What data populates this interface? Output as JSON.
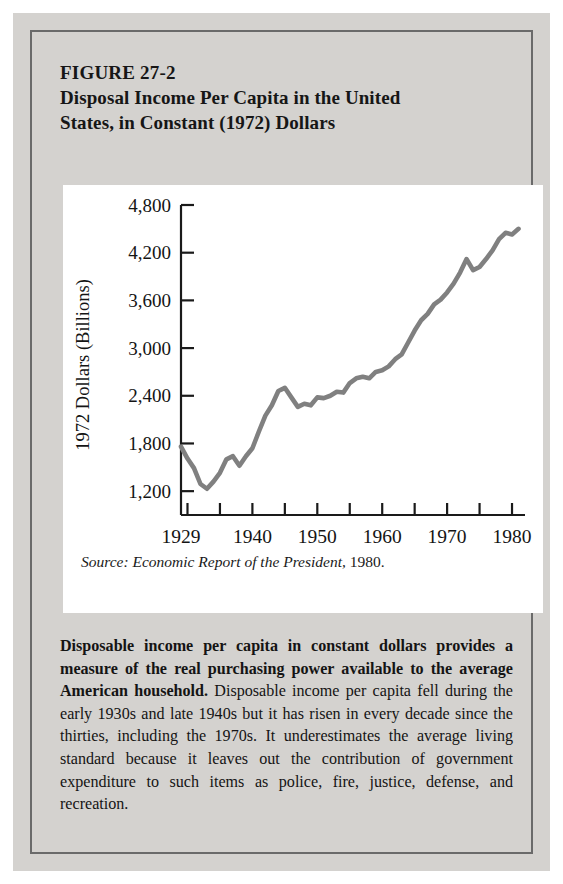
{
  "figure": {
    "label": "FIGURE 27-2",
    "title_line1": "Disposal Income Per Capita in the United",
    "title_line2": "States, in Constant (1972) Dollars",
    "source_prefix": "Source: Economic Report of the President,",
    "source_year": "1980.",
    "caption_bold": "Disposable income per capita in constant dollars provides a measure of the real purchasing power available to the average American household.",
    "caption_rest": " Disposable income per capita fell during the early 1930s and late 1940s but it has risen in every decade since the thirties, including the 1970s. It underestimates the average living standard because it leaves out the contribution of government expenditure to such items as police, fire, justice, defense, and recreation."
  },
  "colors": {
    "page_background": "#d4d2cf",
    "frame_border": "#6a6a6a",
    "panel_background": "#ffffff",
    "axis": "#1a1a1a",
    "series_line": "#808080",
    "text": "#141414"
  },
  "chart_data": {
    "type": "line",
    "title": "Disposal Income Per Capita in the United States, in Constant (1972) Dollars",
    "xlabel": "",
    "ylabel": "1972 Dollars (Billions)",
    "xlim": [
      1929,
      1982
    ],
    "ylim": [
      900,
      4800
    ],
    "grid": false,
    "legend": "none",
    "x_tick_labels": [
      "1929",
      "1940",
      "1950",
      "1960",
      "1970",
      "1980"
    ],
    "x_tick_label_values": [
      1929,
      1940,
      1950,
      1960,
      1970,
      1980
    ],
    "x_minor_tick_values": [
      1930,
      1935,
      1940,
      1945,
      1950,
      1955,
      1960,
      1965,
      1970,
      1975,
      1980
    ],
    "y_tick_labels": [
      "1,200",
      "1,800",
      "2,400",
      "3,000",
      "3,600",
      "4,200",
      "4,800"
    ],
    "y_tick_values": [
      1200,
      1800,
      2400,
      3000,
      3600,
      4200,
      4800
    ],
    "series": [
      {
        "name": "Disposable income per capita (1972 dollars)",
        "x": [
          1929,
          1930,
          1931,
          1932,
          1933,
          1934,
          1935,
          1936,
          1937,
          1938,
          1939,
          1940,
          1941,
          1942,
          1943,
          1944,
          1945,
          1946,
          1947,
          1948,
          1949,
          1950,
          1951,
          1952,
          1953,
          1954,
          1955,
          1956,
          1957,
          1958,
          1959,
          1960,
          1961,
          1962,
          1963,
          1964,
          1965,
          1966,
          1967,
          1968,
          1969,
          1970,
          1971,
          1972,
          1973,
          1974,
          1975,
          1976,
          1977,
          1978,
          1979,
          1980,
          1981
        ],
        "values": [
          1760,
          1610,
          1490,
          1290,
          1230,
          1320,
          1430,
          1600,
          1640,
          1520,
          1640,
          1740,
          1950,
          2150,
          2280,
          2460,
          2500,
          2380,
          2260,
          2300,
          2280,
          2380,
          2370,
          2400,
          2450,
          2440,
          2560,
          2620,
          2640,
          2620,
          2700,
          2720,
          2770,
          2860,
          2920,
          3070,
          3220,
          3350,
          3430,
          3550,
          3610,
          3700,
          3810,
          3950,
          4120,
          3980,
          4020,
          4120,
          4230,
          4370,
          4450,
          4430,
          4500
        ]
      }
    ]
  }
}
